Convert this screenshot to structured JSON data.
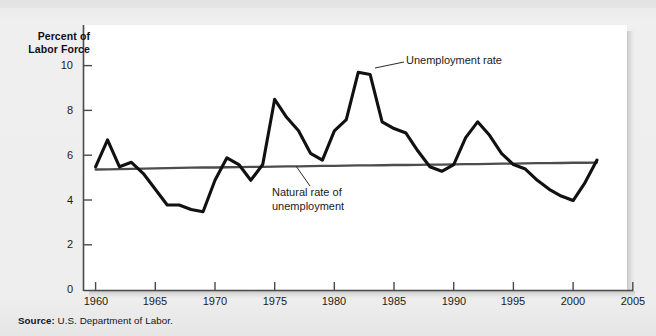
{
  "figure": {
    "source_prefix": "Source:",
    "source_text": "U.S. Department of Labor.",
    "background_color": "#ececed",
    "plot_background_color": "#ffffff"
  },
  "chart_data": {
    "type": "line",
    "title": "",
    "subtitle": "",
    "xlabel": "",
    "ylabel": "Percent of Labor Force",
    "ylabel_line1": "Percent of",
    "ylabel_line2": "Labor Force",
    "xlim": [
      1958.5,
      2005
    ],
    "ylim": [
      0,
      11.2
    ],
    "yticks": [
      0,
      2,
      4,
      6,
      8,
      10
    ],
    "ytick_labels": [
      "0",
      "2",
      "4",
      "6",
      "8",
      "10"
    ],
    "xticks": [
      1960,
      1965,
      1970,
      1975,
      1980,
      1985,
      1990,
      1995,
      2000,
      2005
    ],
    "xtick_labels": [
      "1960",
      "1965",
      "1970",
      "1975",
      "1980",
      "1985",
      "1990",
      "1995",
      "2000",
      "2005"
    ],
    "grid": false,
    "legend_position": "inline-annotations",
    "x": [
      1960,
      1961,
      1962,
      1963,
      1964,
      1965,
      1966,
      1967,
      1968,
      1969,
      1970,
      1971,
      1972,
      1973,
      1974,
      1975,
      1976,
      1977,
      1978,
      1979,
      1980,
      1981,
      1982,
      1983,
      1984,
      1985,
      1986,
      1987,
      1988,
      1989,
      1990,
      1991,
      1992,
      1993,
      1994,
      1995,
      1996,
      1997,
      1998,
      1999,
      2000,
      2001,
      2002
    ],
    "series": [
      {
        "name": "Unemployment rate",
        "color": "#111111",
        "line_width": 3.1,
        "values": [
          5.5,
          6.7,
          5.5,
          5.7,
          5.2,
          4.5,
          3.8,
          3.8,
          3.6,
          3.5,
          4.9,
          5.9,
          5.6,
          4.9,
          5.6,
          8.5,
          7.7,
          7.1,
          6.1,
          5.8,
          7.1,
          7.6,
          9.7,
          9.6,
          7.5,
          7.2,
          7.0,
          6.2,
          5.5,
          5.3,
          5.6,
          6.8,
          7.5,
          6.9,
          6.1,
          5.6,
          5.4,
          4.9,
          4.5,
          4.2,
          4.0,
          4.8,
          5.8
        ]
      },
      {
        "name": "Natural rate of unemployment",
        "color": "#4d4d4d",
        "line_width": 2.3,
        "values": [
          5.38,
          5.39,
          5.4,
          5.41,
          5.42,
          5.43,
          5.44,
          5.45,
          5.46,
          5.47,
          5.47,
          5.48,
          5.49,
          5.5,
          5.5,
          5.51,
          5.52,
          5.52,
          5.53,
          5.54,
          5.54,
          5.55,
          5.56,
          5.56,
          5.57,
          5.58,
          5.58,
          5.59,
          5.6,
          5.6,
          5.61,
          5.62,
          5.62,
          5.63,
          5.64,
          5.64,
          5.65,
          5.66,
          5.66,
          5.67,
          5.68,
          5.68,
          5.69
        ]
      }
    ],
    "annotations": [
      {
        "id": "unemployment-rate",
        "text": "Unemployment rate",
        "line1": "Unemployment rate",
        "line2": ""
      },
      {
        "id": "natural-rate",
        "text": "Natural rate of unemployment",
        "line1": "Natural rate of",
        "line2": "unemployment"
      }
    ]
  }
}
